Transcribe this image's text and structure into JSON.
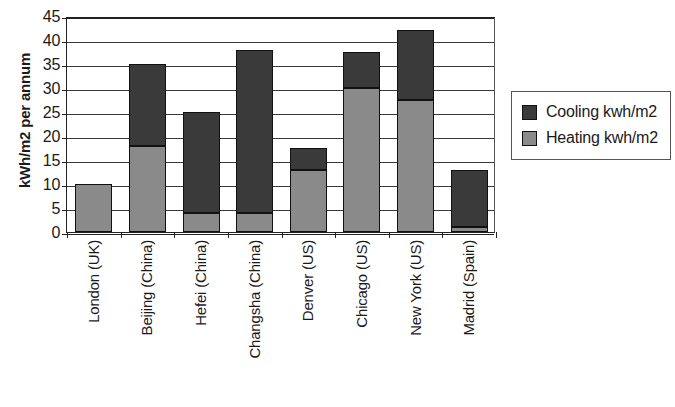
{
  "chart_data": {
    "type": "bar",
    "subtype": "stacked-vertical-bar",
    "title": "",
    "xlabel": "",
    "ylabel": "kWh/m2 per annum",
    "ylim": [
      0,
      45
    ],
    "ytick_step": 5,
    "ytick_labels": [
      "45",
      "40",
      "35",
      "30",
      "25",
      "20",
      "15",
      "10",
      "5",
      "0"
    ],
    "ytick_values": [
      45,
      40,
      35,
      30,
      25,
      20,
      15,
      10,
      5,
      0
    ],
    "grid": "horizontal",
    "legend_position": "right",
    "categories": [
      "London (UK)",
      "Beijing (China)",
      "Hefei (China)",
      "Changsha (China)",
      "Denver (US)",
      "Chicago (US)",
      "New York (US)",
      "Madrid (Spain)"
    ],
    "series": [
      {
        "name": "Heating kwh/m2",
        "color": "#8a8a8a",
        "values": [
          10,
          18,
          4,
          4,
          13,
          30,
          27.5,
          1
        ]
      },
      {
        "name": "Cooling kwh/m2",
        "color": "#3a3a3a",
        "values": [
          0,
          17,
          21,
          34,
          4.5,
          7.5,
          14.5,
          12
        ]
      }
    ],
    "totals": [
      10,
      35,
      25,
      38,
      17.5,
      37.5,
      42,
      13
    ]
  },
  "legend": {
    "items": [
      {
        "label": "Cooling kwh/m2",
        "color": "#3a3a3a",
        "swatch": "cooling-swatch"
      },
      {
        "label": "Heating kwh/m2",
        "color": "#8a8a8a",
        "swatch": "heating-swatch"
      }
    ]
  }
}
